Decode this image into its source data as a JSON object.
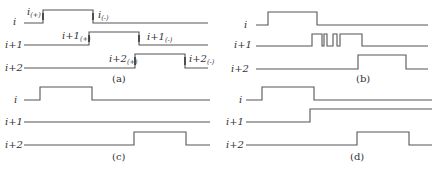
{
  "panels": [
    {
      "id": "a",
      "caption": "(a)",
      "signals": [
        {
          "label": "i",
          "markers": [
            {
              "text": "i",
              "sub": "(+)"
            },
            {
              "text": "i",
              "sub": "(-)"
            }
          ]
        },
        {
          "label": "i+1",
          "markers": [
            {
              "text": "i+1",
              "sub": "(+)"
            },
            {
              "text": "i+1",
              "sub": "(-)"
            }
          ]
        },
        {
          "label": "i+2",
          "markers": [
            {
              "text": "i+2",
              "sub": "(+)"
            },
            {
              "text": "i+2",
              "sub": "(-)"
            }
          ]
        }
      ]
    },
    {
      "id": "b",
      "caption": "(b)",
      "signals": [
        {
          "label": "i"
        },
        {
          "label": "i+1"
        },
        {
          "label": "i+2"
        }
      ]
    },
    {
      "id": "c",
      "caption": "(c)",
      "signals": [
        {
          "label": "i"
        },
        {
          "label": "i+1"
        },
        {
          "label": "i+2"
        }
      ]
    },
    {
      "id": "d",
      "caption": "(d)",
      "signals": [
        {
          "label": "i"
        },
        {
          "label": "i+1"
        },
        {
          "label": "i+2"
        }
      ]
    }
  ]
}
